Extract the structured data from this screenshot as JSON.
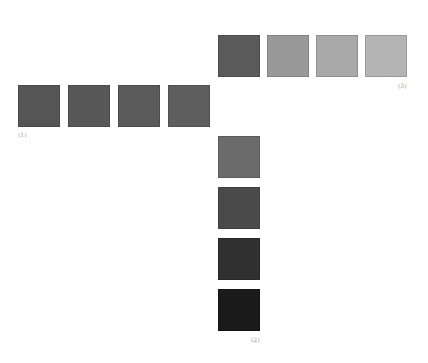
{
  "groups": [
    {
      "label": "(1)",
      "orientation": "horizontal",
      "swatches": [
        {
          "color": "#555555",
          "x": 18,
          "y": 85
        },
        {
          "color": "#585858",
          "x": 68,
          "y": 85
        },
        {
          "color": "#5a5a5a",
          "x": 118,
          "y": 85
        },
        {
          "color": "#5e5e5e",
          "x": 168,
          "y": 85
        }
      ]
    },
    {
      "label": "(2)",
      "orientation": "vertical",
      "swatches": [
        {
          "color": "#6b6b6b",
          "x": 218,
          "y": 136
        },
        {
          "color": "#4a4a4a",
          "x": 218,
          "y": 187
        },
        {
          "color": "#303030",
          "x": 218,
          "y": 238
        },
        {
          "color": "#1a1a1a",
          "x": 218,
          "y": 289
        }
      ]
    },
    {
      "label": "(3)",
      "orientation": "horizontal",
      "swatches": [
        {
          "color": "#5a5a5a",
          "x": 218,
          "y": 35
        },
        {
          "color": "#999999",
          "x": 267,
          "y": 35
        },
        {
          "color": "#a9a9a9",
          "x": 316,
          "y": 35
        },
        {
          "color": "#b4b4b4",
          "x": 365,
          "y": 35
        }
      ]
    }
  ]
}
